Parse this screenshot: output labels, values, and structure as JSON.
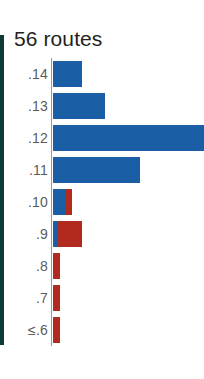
{
  "chart_title": "56 routes",
  "colors": {
    "blue": "#1a5ea6",
    "red": "#b22a1d",
    "label": "#5b5c5e",
    "title": "#231f20",
    "axis": "#9a9a9a",
    "edge_rule": "#0f3b36"
  },
  "axis": {
    "baseline_label": "",
    "categories_title": ""
  },
  "chart_data": {
    "type": "bar",
    "orientation": "horizontal",
    "title": "56 routes",
    "xlabel": "",
    "ylabel": "",
    "grid": false,
    "legend": null,
    "xlim": [
      0,
      11
    ],
    "categories": [
      ".14",
      ".13",
      ".12",
      ".11",
      ".10",
      ".9",
      ".8",
      ".7",
      "≤.6"
    ],
    "series": [
      {
        "name": "blue",
        "color": "#1a5ea6",
        "values": [
          2.0,
          3.5,
          11.0,
          5.8,
          0.9,
          0.25,
          0,
          0,
          0
        ]
      },
      {
        "name": "red",
        "color": "#b22a1d",
        "values": [
          0,
          0,
          0,
          0,
          0.4,
          1.7,
          0.45,
          0.45,
          0.45
        ]
      }
    ]
  },
  "rows": [
    {
      "label": ".14",
      "blue_w": 29,
      "red_w": 0,
      "clipped": false
    },
    {
      "label": ".13",
      "blue_w": 52,
      "red_w": 0,
      "clipped": false
    },
    {
      "label": ".12",
      "blue_w": 151,
      "red_w": 0,
      "clipped": true
    },
    {
      "label": ".11",
      "blue_w": 87,
      "red_w": 0,
      "clipped": false
    },
    {
      "label": ".10",
      "blue_w": 13,
      "red_w": 6,
      "clipped": false
    },
    {
      "label": ".9",
      "blue_w": 4,
      "red_w": 25,
      "clipped": false
    },
    {
      "label": ".8",
      "blue_w": 0,
      "red_w": 7,
      "clipped": false
    },
    {
      "label": ".7",
      "blue_w": 0,
      "red_w": 7,
      "clipped": false
    },
    {
      "label": "≤.6",
      "blue_w": 0,
      "red_w": 7,
      "clipped": false
    }
  ]
}
